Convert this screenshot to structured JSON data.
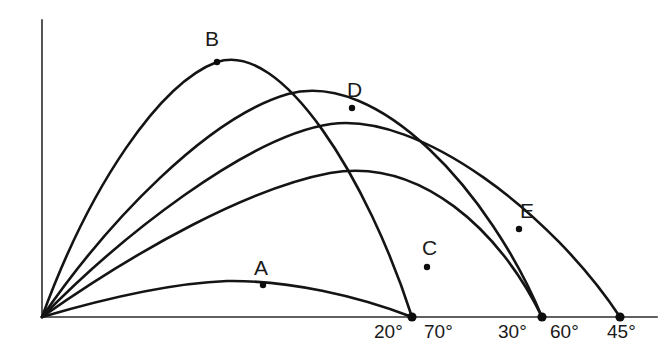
{
  "figure": {
    "background_color": "#ffffff",
    "curve_color": "#141414",
    "axis_color": "#2b2b2b",
    "label_color": "#1a1a1a"
  },
  "axes": {
    "origin": {
      "x": 42,
      "y": 317
    },
    "y_axis_top": {
      "x": 42,
      "y": 20
    },
    "x_axis_right": {
      "x": 657,
      "y": 317
    },
    "x_axis_label": "",
    "y_axis_label": "",
    "grid": false
  },
  "tick_labels": [
    {
      "id": "tick-20",
      "text": "20°",
      "x": 374,
      "y": 322
    },
    {
      "id": "tick-70",
      "text": "70°",
      "x": 424,
      "y": 322
    },
    {
      "id": "tick-30",
      "text": "30°",
      "x": 498,
      "y": 322
    },
    {
      "id": "tick-60",
      "text": "60°",
      "x": 550,
      "y": 322
    },
    {
      "id": "tick-45",
      "text": "45°",
      "x": 607,
      "y": 322
    }
  ],
  "point_labels": [
    {
      "id": "label-A",
      "text": "A",
      "x": 254,
      "y": 257
    },
    {
      "id": "label-B",
      "text": "B",
      "x": 205,
      "y": 28
    },
    {
      "id": "label-C",
      "text": "C",
      "x": 422,
      "y": 237
    },
    {
      "id": "label-D",
      "text": "D",
      "x": 347,
      "y": 79
    },
    {
      "id": "label-E",
      "text": "E",
      "x": 520,
      "y": 200
    }
  ],
  "marked_points": [
    {
      "id": "point-A",
      "label": "A",
      "curve": "20°",
      "x": 263,
      "y": 285
    },
    {
      "id": "point-B",
      "label": "B",
      "curve": "70°",
      "x": 217,
      "y": 62
    },
    {
      "id": "point-C",
      "label": "C",
      "curve": "30°",
      "x": 427,
      "y": 267
    },
    {
      "id": "point-D",
      "label": "D",
      "curve": "60°",
      "x": 352,
      "y": 108
    },
    {
      "id": "point-E",
      "label": "E",
      "curve": "45°",
      "x": 519,
      "y": 229
    }
  ],
  "landing_points": [
    {
      "id": "landing-20-70",
      "x": 412,
      "y": 317,
      "angles": [
        "20°",
        "70°"
      ]
    },
    {
      "id": "landing-30-60",
      "x": 542,
      "y": 317,
      "angles": [
        "30°",
        "60°"
      ]
    },
    {
      "id": "landing-45",
      "x": 620,
      "y": 317,
      "angles": [
        "45°"
      ]
    }
  ],
  "chart_data": {
    "type": "line",
    "xlabel": "",
    "ylabel": "",
    "xlim": [
      42,
      657
    ],
    "ylim": [
      317,
      20
    ],
    "grid": false,
    "legend": "none",
    "annotations": [
      "A",
      "B",
      "C",
      "D",
      "E",
      "20°",
      "70°",
      "30°",
      "60°",
      "45°"
    ],
    "series": [
      {
        "name": "20°",
        "angle_deg": 20,
        "marked_point": "A",
        "range_px": 370,
        "apex": {
          "x": 227,
          "y": 281
        },
        "path": "M 42 317 C 110 297, 175 283, 227 281 C 288 280, 358 296, 412 317"
      },
      {
        "name": "70°",
        "angle_deg": 70,
        "marked_point": "B",
        "range_px": 370,
        "apex": {
          "x": 217,
          "y": 62
        },
        "path": "M 42 317 C 90 185, 160 83, 217 62 C 282 40, 368 180, 412 317"
      },
      {
        "name": "30°",
        "angle_deg": 30,
        "marked_point": "C",
        "range_px": 500,
        "apex": {
          "x": 330,
          "y": 173
        },
        "path": "M 42 317 C 140 248, 250 188, 330 173 C 420 157, 500 230, 542 317"
      },
      {
        "name": "60°",
        "angle_deg": 60,
        "marked_point": "D",
        "range_px": 500,
        "apex": {
          "x": 288,
          "y": 94
        },
        "path": "M 42 317 C 108 221, 208 117, 288 94 C 378 69, 490 192, 542 317"
      },
      {
        "name": "45°",
        "angle_deg": 45,
        "marked_point": "E",
        "range_px": 578,
        "apex": {
          "x": 331,
          "y": 124
        },
        "path": "M 42 317 C 118 239, 247 136, 331 124 C 420 112, 552 214, 620 317"
      }
    ]
  }
}
